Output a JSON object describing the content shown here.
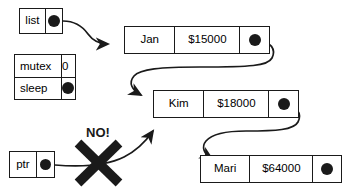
{
  "diagram": {
    "stroke_color": "#1a1a1a",
    "background_color": "#ffffff"
  },
  "pointer_boxes": [
    {
      "id": "list",
      "label": "list",
      "pointer_icon": "filled-circle-pointer"
    },
    {
      "id": "ptr",
      "label": "ptr",
      "pointer_icon": "filled-circle-pointer"
    }
  ],
  "struct_table": {
    "name": "mutex-sleep-table",
    "rows": [
      {
        "label": "mutex",
        "value": "0",
        "value_kind": "number"
      },
      {
        "label": "sleep",
        "value": "",
        "value_kind": "filled-circle-pointer"
      }
    ]
  },
  "nodes": [
    {
      "id": "jan",
      "name": "Jan",
      "amount": "$15000",
      "next_icon": "filled-circle-pointer"
    },
    {
      "id": "kim",
      "name": "Kim",
      "amount": "$18000",
      "next_icon": "filled-circle-pointer"
    },
    {
      "id": "mari",
      "name": "Mari",
      "amount": "$64000",
      "next_icon": "filled-circle-pointer"
    }
  ],
  "annotations": {
    "forbidden_label": "NO!",
    "forbidden_mark": "x-cross-mark"
  }
}
